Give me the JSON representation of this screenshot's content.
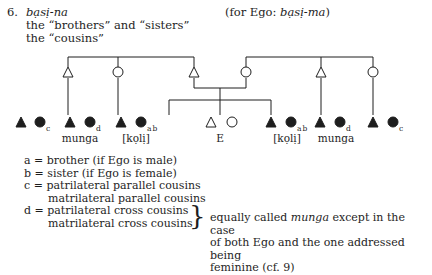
{
  "header": {
    "number": "6.",
    "term": "bạsị-na",
    "line1": "the “brothers” and “sisters”",
    "line2": "the “cousins”",
    "alt_prefix": "(for Ego: ",
    "alt_term": "bạsị-ma",
    "alt_suffix": ")"
  },
  "diagram": {
    "symbols": {
      "male": "triangle",
      "female": "circle",
      "filled": "referent of the term",
      "open": "relative / Ego"
    },
    "parents": [
      {
        "sex": "male",
        "x": 68
      },
      {
        "sex": "female",
        "x": 118
      },
      {
        "sex": "male",
        "x": 194,
        "role": "Ego's father"
      },
      {
        "sex": "female",
        "x": 246,
        "role": "Ego's mother"
      },
      {
        "sex": "male",
        "x": 321
      },
      {
        "sex": "female",
        "x": 373
      }
    ],
    "children": [
      {
        "pair": "filled",
        "subscript": "c",
        "label": ""
      },
      {
        "pair": "filled",
        "subscript": "d",
        "label": "munga"
      },
      {
        "pair": "filled",
        "subscript": "ab",
        "label": "[kọlị]"
      },
      {
        "pair": "open",
        "subscript": "",
        "label": "E"
      },
      {
        "pair": "filled",
        "subscript": "ab",
        "label": "[kọlị]"
      },
      {
        "pair": "filled",
        "subscript": "d",
        "label": "munga"
      },
      {
        "pair": "filled",
        "subscript": "c",
        "label": ""
      }
    ]
  },
  "legend": [
    {
      "key": "a",
      "eq": "=",
      "text": "brother (if Ego is male)"
    },
    {
      "key": "b",
      "eq": "=",
      "text": "sister (if Ego is female)"
    },
    {
      "key": "c",
      "eq": "=",
      "text": "patrilateral parallel cousins",
      "text2": "matrilateral parallel cousins"
    },
    {
      "key": "d",
      "eq": "=",
      "text": "patrilateral cross cousins",
      "text2": "matrilateral cross cousins"
    }
  ],
  "note": {
    "line1_a": "equally called ",
    "line1_term": "munga",
    "line1_b": " except in the case",
    "line2": "of both Ego and the one addressed being",
    "line3": "feminine (cf. 9)"
  },
  "colors": {
    "ink": "#1e1e1e",
    "background": "#ffffff"
  }
}
